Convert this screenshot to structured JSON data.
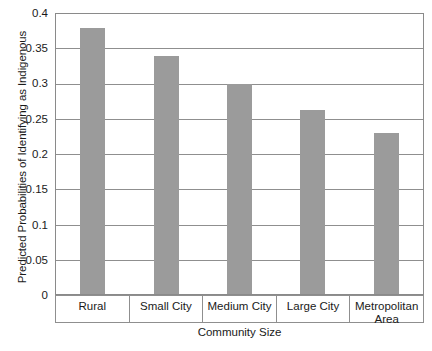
{
  "chart_data": {
    "type": "bar",
    "title": "",
    "xlabel": "Community Size",
    "ylabel": "Predicted Probabilities of Identifying as Indigenous",
    "categories": [
      "Rural",
      "Small City",
      "Medium City",
      "Large City",
      "Metropolitan Area"
    ],
    "values": [
      0.38,
      0.34,
      0.3,
      0.263,
      0.23
    ],
    "ylim": [
      0,
      0.4
    ],
    "ytick_labels": [
      "0.4",
      "0.35",
      "0.3",
      "0.25",
      "0.2",
      "0.15",
      "0.1",
      "0.05",
      "0"
    ],
    "ytick_values": [
      0.4,
      0.35,
      0.3,
      0.25,
      0.2,
      0.15,
      0.1,
      0.05,
      0
    ],
    "grid": true,
    "legend": null,
    "series": [
      {
        "name": "Predicted Probability",
        "values": [
          0.38,
          0.34,
          0.3,
          0.263,
          0.23
        ]
      }
    ],
    "colors": {
      "bar_fill": "#9b9b9b",
      "gridline": "#8f8f8f",
      "axis": "#8a8a8a",
      "text": "#1a1a1a",
      "background": "#ffffff"
    }
  }
}
